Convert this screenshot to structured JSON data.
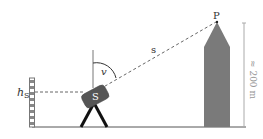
{
  "diagram": {
    "labels": {
      "station_height": "h",
      "station_height_sub": "S",
      "instrument": "S",
      "angle": "v",
      "distance": "s",
      "point": "P",
      "tower_height": "≈ 200 m"
    },
    "colors": {
      "ink": "#222222",
      "tower_fill": "#7a7a7a",
      "instrument_fill": "#555555",
      "dim_line": "#aaaaaa",
      "dash": "#666666"
    }
  }
}
